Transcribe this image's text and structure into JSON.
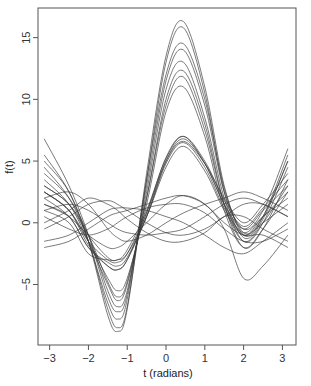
{
  "chart_data": {
    "type": "line",
    "title": "",
    "xlabel": "t (radians)",
    "ylabel": "f(t)",
    "xlim": [
      -3.3,
      3.35
    ],
    "ylim": [
      -9.9,
      17.4
    ],
    "x_ticks": [
      -3,
      -2,
      -1,
      0,
      1,
      2,
      3
    ],
    "x_tick_labels": [
      "−3",
      "−2",
      "−1",
      "0",
      "1",
      "2",
      "3"
    ],
    "y_ticks": [
      -5,
      0,
      5,
      10,
      15
    ],
    "y_tick_labels": [
      "−5",
      "0",
      "5",
      "10",
      "15"
    ],
    "grid": false,
    "legend": null,
    "x": [
      -3.14,
      -2.5,
      -2.0,
      -1.5,
      -1.25,
      -1.0,
      -0.5,
      0.0,
      0.45,
      1.0,
      1.5,
      2.0,
      2.5,
      3.14
    ],
    "series": [
      {
        "name": "curve-1",
        "values": [
          5.0,
          2.5,
          -1.5,
          -7.5,
          -8.8,
          -7.0,
          4.0,
          13.5,
          16.3,
          11.0,
          3.0,
          -1.0,
          0.5,
          5.5
        ]
      },
      {
        "name": "curve-2",
        "values": [
          4.5,
          2.0,
          -1.5,
          -7.0,
          -8.5,
          -6.8,
          3.5,
          13.0,
          15.8,
          10.5,
          2.5,
          -1.2,
          0.3,
          5.0
        ]
      },
      {
        "name": "curve-3",
        "values": [
          6.8,
          3.0,
          -1.0,
          -6.0,
          -7.2,
          -5.8,
          3.0,
          11.5,
          14.0,
          9.5,
          2.5,
          -0.5,
          1.0,
          6.0
        ]
      },
      {
        "name": "curve-4",
        "values": [
          4.0,
          2.0,
          -1.0,
          -5.5,
          -6.8,
          -5.5,
          2.5,
          10.8,
          13.0,
          8.5,
          2.0,
          -1.5,
          0.0,
          4.5
        ]
      },
      {
        "name": "curve-5",
        "values": [
          3.5,
          1.5,
          -1.5,
          -5.0,
          -6.3,
          -5.0,
          2.0,
          10.0,
          12.3,
          8.0,
          1.5,
          -2.0,
          -0.5,
          3.5
        ]
      },
      {
        "name": "curve-6",
        "values": [
          3.0,
          1.5,
          -1.0,
          -4.8,
          -6.0,
          -4.8,
          2.0,
          9.5,
          11.8,
          7.5,
          1.5,
          -1.5,
          0.0,
          3.0
        ]
      },
      {
        "name": "curve-7",
        "values": [
          2.5,
          1.0,
          -1.5,
          -4.5,
          -5.5,
          -4.5,
          1.5,
          9.0,
          11.0,
          7.0,
          1.0,
          -2.0,
          -0.5,
          2.5
        ]
      },
      {
        "name": "curve-8",
        "values": [
          2.0,
          0.5,
          -2.0,
          -3.5,
          -3.8,
          -3.0,
          0.5,
          5.0,
          6.8,
          4.8,
          1.5,
          -0.5,
          1.0,
          3.0
        ]
      },
      {
        "name": "curve-9",
        "values": [
          1.5,
          0.5,
          -2.0,
          -3.2,
          -3.5,
          -2.8,
          0.5,
          4.8,
          6.5,
          4.5,
          1.2,
          -0.8,
          0.5,
          2.0
        ]
      },
      {
        "name": "curve-10",
        "values": [
          2.5,
          1.0,
          -1.5,
          -3.0,
          -3.2,
          -2.5,
          0.8,
          5.0,
          6.6,
          4.8,
          2.0,
          0.0,
          1.5,
          4.0
        ]
      },
      {
        "name": "curve-11",
        "values": [
          1.0,
          0.0,
          -2.5,
          -3.0,
          -3.0,
          -2.5,
          0.5,
          4.5,
          6.2,
          4.2,
          1.0,
          -1.0,
          0.0,
          1.5
        ]
      },
      {
        "name": "curve-12",
        "values": [
          3.0,
          1.5,
          -1.0,
          -2.8,
          -3.0,
          -2.2,
          1.0,
          5.2,
          7.0,
          5.0,
          1.8,
          -0.3,
          1.2,
          3.5
        ]
      },
      {
        "name": "curve-13",
        "values": [
          -0.5,
          0.5,
          1.5,
          1.8,
          1.5,
          1.0,
          0.0,
          -0.8,
          -1.0,
          -0.5,
          0.5,
          1.5,
          1.5,
          0.5
        ]
      },
      {
        "name": "curve-14",
        "values": [
          0.5,
          -0.5,
          -1.0,
          -0.5,
          0.0,
          0.5,
          1.2,
          1.5,
          1.5,
          0.8,
          -0.5,
          -1.5,
          -1.5,
          -0.5
        ]
      },
      {
        "name": "curve-15",
        "values": [
          -1.5,
          -1.0,
          0.0,
          1.0,
          1.2,
          1.2,
          1.0,
          0.5,
          0.0,
          -1.0,
          -2.0,
          -2.5,
          -1.5,
          0.0
        ]
      },
      {
        "name": "curve-16",
        "values": [
          1.0,
          1.5,
          1.0,
          0.0,
          -0.5,
          -0.8,
          -1.0,
          -0.8,
          -0.5,
          0.5,
          1.5,
          2.0,
          1.5,
          0.5
        ]
      },
      {
        "name": "curve-17",
        "values": [
          -2.0,
          -1.5,
          -0.5,
          0.5,
          0.8,
          1.0,
          1.5,
          2.0,
          2.2,
          1.5,
          0.0,
          -1.0,
          -1.0,
          -2.0
        ]
      },
      {
        "name": "curve-18",
        "values": [
          2.0,
          2.5,
          1.5,
          -0.5,
          -1.2,
          -1.5,
          -1.0,
          0.0,
          0.8,
          1.5,
          2.0,
          2.5,
          2.0,
          1.0
        ]
      },
      {
        "name": "curve-19",
        "values": [
          0.0,
          1.0,
          2.0,
          1.5,
          1.0,
          0.3,
          -0.8,
          -1.5,
          -1.5,
          -0.8,
          0.5,
          0.5,
          -0.5,
          -1.5
        ]
      },
      {
        "name": "curve-20",
        "values": [
          1.5,
          0.5,
          -1.0,
          -2.0,
          -2.0,
          -1.5,
          0.0,
          1.5,
          2.2,
          1.5,
          -0.5,
          -4.5,
          -3.5,
          -1.0
        ]
      },
      {
        "name": "curve-21",
        "values": [
          5.5,
          2.5,
          -1.5,
          -6.5,
          -7.8,
          -6.2,
          3.5,
          12.0,
          14.5,
          10.0,
          2.8,
          -0.8,
          0.5,
          5.0
        ]
      },
      {
        "name": "curve-22",
        "values": [
          2.5,
          1.0,
          -1.8,
          -3.5,
          -3.8,
          -3.0,
          0.8,
          5.3,
          7.0,
          4.8,
          1.5,
          -1.0,
          0.5,
          2.5
        ]
      }
    ]
  },
  "axes": {
    "xlabel": "t (radians)",
    "ylabel": "f(t)"
  }
}
